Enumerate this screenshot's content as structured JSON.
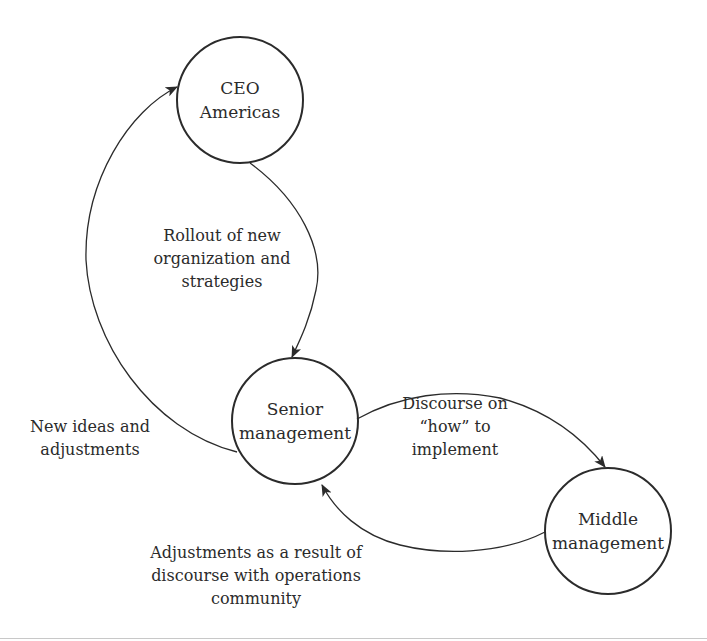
{
  "diagram": {
    "type": "flow-cycle",
    "colors": {
      "stroke": "#2b2b2b",
      "text": "#2b2b2b",
      "background": "#ffffff"
    },
    "nodes": [
      {
        "id": "ceo",
        "lines": [
          "CEO",
          "Americas"
        ]
      },
      {
        "id": "senior",
        "lines": [
          "Senior",
          "management"
        ]
      },
      {
        "id": "middle",
        "lines": [
          "Middle",
          "management"
        ]
      }
    ],
    "edges": [
      {
        "id": "rollout",
        "from": "ceo",
        "to": "senior",
        "lines": [
          "Rollout of new",
          "organization and",
          "strategies"
        ]
      },
      {
        "id": "new-ideas",
        "from": "senior",
        "to": "ceo",
        "lines": [
          "New ideas and",
          "adjustments"
        ]
      },
      {
        "id": "discourse",
        "from": "senior",
        "to": "middle",
        "lines": [
          "Discourse on",
          "“how” to",
          "implement"
        ]
      },
      {
        "id": "adjustments",
        "from": "middle",
        "to": "senior",
        "lines": [
          "Adjustments as a result of",
          "discourse with operations",
          "community"
        ]
      }
    ]
  }
}
